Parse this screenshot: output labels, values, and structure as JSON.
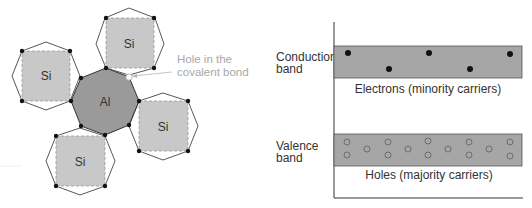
{
  "lattice": {
    "center_atom": "Al",
    "neighbor_atoms": [
      "Si",
      "Si",
      "Si",
      "Si"
    ],
    "hole_label_line1": "Hole in the",
    "hole_label_line2": "covalent bond"
  },
  "band_diagram": {
    "conduction_label_line1": "Conduction",
    "conduction_label_line2": "band",
    "valence_label_line1": "Valence",
    "valence_label_line2": "band",
    "electrons_caption": "Electrons (minority carriers)",
    "holes_caption": "Holes (majority carriers)",
    "electron_count": 5,
    "hole_count": 14
  },
  "colors": {
    "al_fill": "#9a9a9a",
    "si_fill": "#c8c8c8",
    "band_fill": "#a6a6a6",
    "outline": "#333333",
    "hole_label": "#a8a8a8"
  }
}
